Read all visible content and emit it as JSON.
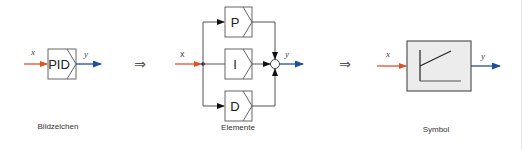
{
  "colors": {
    "input": "#e0502a",
    "output": "#1f4e9a",
    "line": "#555555",
    "block_border": "#666666",
    "symbol_fill": "#ececec"
  },
  "panels": [
    {
      "caption": "Bildzeichen",
      "input_label": "x",
      "output_label": "y",
      "block_label": "PID"
    },
    {
      "caption": "Elemente",
      "input_label": "x",
      "output_label": "y",
      "blocks": [
        {
          "label": "P"
        },
        {
          "label": "I"
        },
        {
          "label": "D"
        }
      ]
    },
    {
      "caption": "Symbol",
      "input_label": "x",
      "output_label": "y"
    }
  ],
  "implies": [
    "⇒",
    "⇒"
  ]
}
